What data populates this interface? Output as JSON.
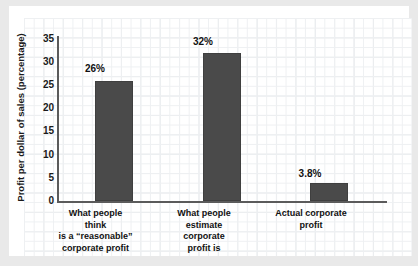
{
  "chart_data": {
    "type": "bar",
    "title": "",
    "subtitle": "",
    "xlabel": "",
    "ylabel": "Profit per dollar of sales (percentage)",
    "ylim": [
      0,
      35
    ],
    "yticks": [
      0,
      5,
      10,
      15,
      20,
      25,
      30,
      35
    ],
    "ytick_labels": [
      "0",
      "5",
      "10",
      "15",
      "20",
      "25",
      "30",
      "35"
    ],
    "grid": true,
    "legend": "none",
    "categories": [
      "What people think is a “reasonable” corporate profit",
      "What people estimate corporate profit is",
      "Actual corporate profit"
    ],
    "category_lines": [
      [
        "What people think",
        "is a “reasonable”",
        "corporate profit"
      ],
      [
        "What people",
        "estimate corporate",
        "profit is"
      ],
      [
        "Actual corporate",
        "profit"
      ]
    ],
    "values": [
      26,
      32,
      3.8
    ],
    "value_labels": [
      "26%",
      "32%",
      "3.8%"
    ],
    "bar_color": "#4a4a4a",
    "axis_color": "#5b5b5b",
    "grid_color": "#e2e5e8",
    "background_color": "#ffffff",
    "page_background_color": "#e9e9e9"
  }
}
